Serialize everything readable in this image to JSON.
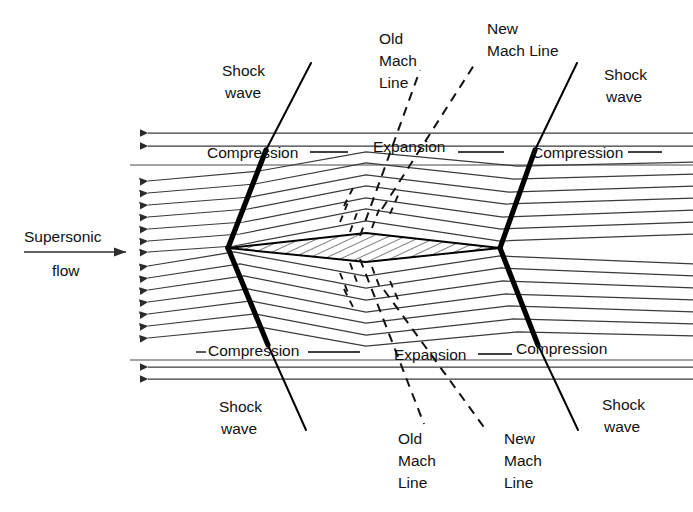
{
  "figure": {
    "type": "schematic-diagram",
    "background_color": "#ffffff",
    "line_color": "#000000",
    "streamline_color": "#4a4a4a"
  },
  "labels": {
    "inflow_line1": "Supersonic",
    "inflow_line2": "flow",
    "shock_top_left": {
      "line1": "Shock",
      "line2": "wave"
    },
    "shock_top_right": {
      "line1": "Shock",
      "line2": "wave"
    },
    "shock_bottom_left": {
      "line1": "Shock",
      "line2": "wave"
    },
    "shock_bottom_right": {
      "line1": "Shock",
      "line2": "wave"
    },
    "compression_top_left": "Compression",
    "compression_top_right": "Compression",
    "compression_bottom_left": "Compression",
    "compression_bottom_right": "Compression",
    "expansion_top": "Expansion",
    "expansion_bottom": "Expansion",
    "old_mach_top": {
      "line1": "Old",
      "line2": "Mach",
      "line3": "Line"
    },
    "new_mach_top": {
      "line1": "New",
      "line2": "Mach Line"
    },
    "old_mach_bottom": {
      "line1": "Old",
      "line2": "Mach",
      "line3": "Line"
    },
    "new_mach_bottom": {
      "line1": "New",
      "line2": "Mach",
      "line3": "Line"
    }
  },
  "geometry": {
    "airfoil": {
      "leading_edge": [
        228,
        248
      ],
      "trailing_edge": [
        500,
        248
      ],
      "upper_apex": [
        366,
        233
      ],
      "lower_apex": [
        366,
        262
      ],
      "fill": "hatched"
    },
    "shocks": [
      {
        "name": "leading-edge-upper-shock",
        "from": [
          228,
          248
        ],
        "to": [
          266,
          150
        ]
      },
      {
        "name": "leading-edge-lower-shock",
        "from": [
          228,
          248
        ],
        "to": [
          268,
          345
        ]
      },
      {
        "name": "trailing-edge-upper-shock",
        "from": [
          500,
          248
        ],
        "to": [
          535,
          150
        ]
      },
      {
        "name": "trailing-edge-lower-shock",
        "from": [
          500,
          248
        ],
        "to": [
          538,
          345
        ]
      }
    ],
    "mach_lines": [
      {
        "name": "old-mach-line-top",
        "from": [
          366,
          233
        ],
        "to": [
          415,
          95
        ]
      },
      {
        "name": "new-mach-line-top",
        "from": [
          383,
          207
        ],
        "to": [
          470,
          78
        ]
      },
      {
        "name": "old-mach-line-bottom",
        "from": [
          366,
          262
        ],
        "to": [
          418,
          400
        ]
      },
      {
        "name": "new-mach-line-bottom",
        "from": [
          385,
          290
        ],
        "to": [
          478,
          418
        ]
      }
    ],
    "inflow_arrow": {
      "from": [
        24,
        252
      ],
      "to": [
        128,
        252
      ]
    },
    "streamline_count": 19
  }
}
